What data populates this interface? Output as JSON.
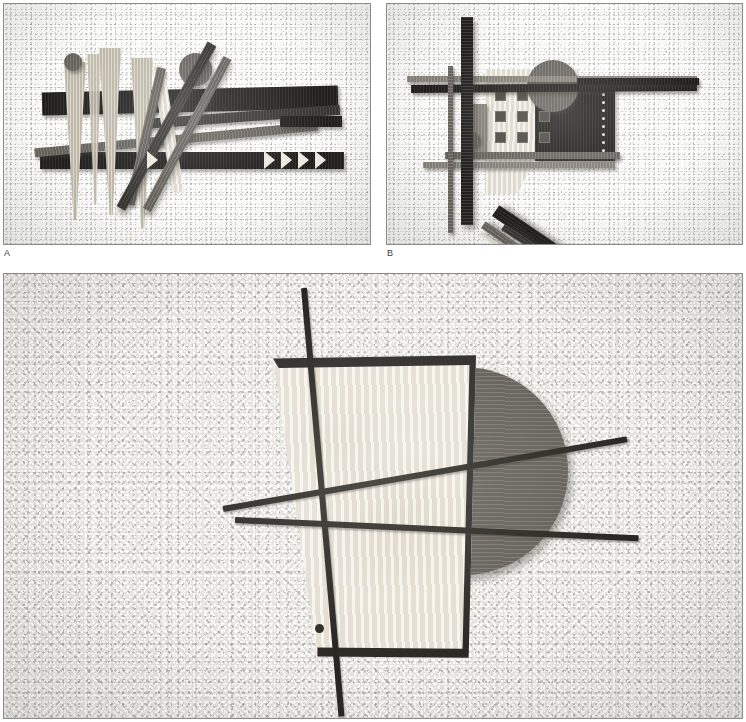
{
  "figure": {
    "type": "photographic-figure-plate",
    "panel_count": 3,
    "background_color": "#ffffff",
    "canvas_color": "#e4e3dd",
    "border_color": "#8c8c86"
  },
  "labels": {
    "a": "A",
    "b": "B"
  },
  "panels": [
    {
      "id": "panel-a",
      "label": "A",
      "subject": "abstract wooden relief assemblage with tapered spikes, bars, disc and sawtooth band",
      "x": 3,
      "y": 3,
      "width": 368,
      "height": 242,
      "background": "speckled light canvas",
      "elements": [
        {
          "name": "small-disc-top-left",
          "shape": "circle",
          "tone": "mid-gray wood"
        },
        {
          "name": "large-disc-top-center",
          "shape": "circle",
          "tone": "mid-gray wood"
        },
        {
          "name": "tapered-spike-1",
          "shape": "tapered vertical wedge",
          "tone": "light wood"
        },
        {
          "name": "tapered-spike-2",
          "shape": "tapered vertical wedge",
          "tone": "light wood"
        },
        {
          "name": "tapered-spike-3",
          "shape": "tapered vertical wedge",
          "tone": "light wood"
        },
        {
          "name": "tapered-spike-4",
          "shape": "tapered vertical wedge",
          "tone": "light wood"
        },
        {
          "name": "dark-horizontal-bar-upper",
          "shape": "bar",
          "tone": "very dark"
        },
        {
          "name": "dark-horizontal-bar-lower",
          "shape": "bar",
          "tone": "very dark"
        },
        {
          "name": "thin-angled-bar",
          "shape": "bar",
          "tone": "dark"
        },
        {
          "name": "diagonal-rod-1",
          "shape": "long rod",
          "tone": "dark wood"
        },
        {
          "name": "diagonal-rod-2",
          "shape": "long rod",
          "tone": "dark wood"
        },
        {
          "name": "v-wedge",
          "shape": "narrow V",
          "tone": "pale wood"
        },
        {
          "name": "sawtooth-band",
          "shape": "row of 4 pale triangles",
          "tone": "pale"
        },
        {
          "name": "single-arrow",
          "shape": "pale triangle",
          "tone": "pale"
        }
      ]
    },
    {
      "id": "panel-b",
      "label": "B",
      "subject": "abstract wooden relief assemblage with grid of squares, disc, crossing rods and dotted strip",
      "x": 386,
      "y": 3,
      "width": 357,
      "height": 242,
      "background": "speckled light canvas",
      "elements": [
        {
          "name": "vertical-dark-bar-thick",
          "shape": "vertical bar",
          "tone": "very dark"
        },
        {
          "name": "vertical-dark-bar-thin",
          "shape": "vertical bar",
          "tone": "mid gray"
        },
        {
          "name": "pale-quadrilateral-field",
          "shape": "angled pale panel",
          "tone": "pale wood"
        },
        {
          "name": "square-grid",
          "shape": "3x3 grid of small dark squares",
          "count": 8
        },
        {
          "name": "disc",
          "shape": "circle",
          "tone": "mid-gray wood"
        },
        {
          "name": "small-disc",
          "shape": "circle",
          "tone": "mid gray"
        },
        {
          "name": "dark-rectangle-with-perforations",
          "shape": "rectangle",
          "tone": "very dark"
        },
        {
          "name": "horizontal-bar-upper",
          "shape": "bar",
          "tone": "very dark"
        },
        {
          "name": "horizontal-bar-mid",
          "shape": "bar",
          "tone": "mid gray"
        },
        {
          "name": "horizontal-bar-lower",
          "shape": "bar",
          "tone": "mid gray"
        },
        {
          "name": "diagonal-rod-1",
          "shape": "long rod",
          "tone": "very dark"
        },
        {
          "name": "diagonal-rod-2",
          "shape": "long rod",
          "tone": "mid gray"
        },
        {
          "name": "diagonal-rod-3",
          "shape": "long rod",
          "tone": "pale"
        },
        {
          "name": "diagonal-wedge",
          "shape": "tapered diagonal",
          "tone": "dark"
        }
      ]
    },
    {
      "id": "panel-c",
      "label": "",
      "subject": "large abstract assemblage: gray disc, pale trapezoid panel and four crossing dark rods",
      "x": 3,
      "y": 273,
      "width": 740,
      "height": 446,
      "background": "speckled light canvas",
      "elements": [
        {
          "name": "gray-disc",
          "shape": "circle",
          "tone": "mid-gray wood",
          "diameter_px": 208
        },
        {
          "name": "pale-trapezoid",
          "shape": "trapezoid panel",
          "tone": "pale birch wood"
        },
        {
          "name": "trapezoid-hole",
          "shape": "small circular hole",
          "tone": "dark"
        },
        {
          "name": "rod-steep-vertical",
          "shape": "long rod",
          "tone": "near-black"
        },
        {
          "name": "rod-upper-diagonal",
          "shape": "long rod",
          "tone": "near-black"
        },
        {
          "name": "rod-lower-diagonal",
          "shape": "long rod",
          "tone": "near-black"
        }
      ]
    }
  ],
  "colors": {
    "canvas": "#e4e3dd",
    "rod_dark": "#26251f",
    "wood_dark": "#3b3a37",
    "wood_very_dark": "#232221",
    "wood_mid": "#6e6b64",
    "wood_light": "#c9c3b4",
    "wood_pale": "#ece7db",
    "disc_gray": "#6a675f",
    "border": "#8c8c86",
    "label_text": "#3a3a38"
  }
}
